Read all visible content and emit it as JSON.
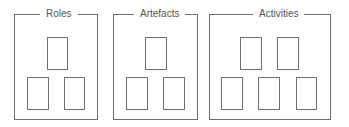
{
  "diagram": {
    "groups": [
      {
        "label": "Roles",
        "box_count": 3
      },
      {
        "label": "Artefacts",
        "box_count": 3
      },
      {
        "label": "Activities",
        "box_count": 5
      }
    ]
  }
}
